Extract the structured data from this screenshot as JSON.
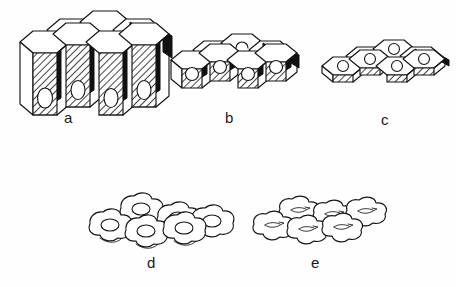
{
  "figure": {
    "background_color": "#fefefe",
    "ink_color": "#141414",
    "shade_color": "#111111",
    "panel_count": 5
  },
  "panels": [
    {
      "id": "a",
      "label": "a",
      "cell_shape": "tall columnar hexagonal prisms",
      "nucleus_shape": "oval",
      "nucleus_position": "basal",
      "rows": 2,
      "front_cells": 4,
      "back_cells": 3,
      "label_x": 68,
      "label_y": 117
    },
    {
      "id": "b",
      "label": "b",
      "cell_shape": "cuboidal hexagonal prisms",
      "nucleus_shape": "round",
      "nucleus_position": "central",
      "rows": 2,
      "front_cells": 4,
      "back_cells": 3,
      "label_x": 228,
      "label_y": 117
    },
    {
      "id": "c",
      "label": "c",
      "cell_shape": "low flattened hexagonal plates",
      "nucleus_shape": "round",
      "nucleus_position": "central",
      "rows": 2,
      "front_cells": 4,
      "back_cells": 3,
      "label_x": 384,
      "label_y": 112
    },
    {
      "id": "d",
      "label": "d",
      "cell_shape": "squamous polygonal blobs",
      "nucleus_shape": "oval",
      "nucleus_position": "central",
      "rows": 2,
      "front_cells": 3,
      "back_cells": 3,
      "label_x": 151,
      "label_y": 262
    },
    {
      "id": "e",
      "label": "e",
      "cell_shape": "very flat squamous cells",
      "nucleus_shape": "elongated spindle",
      "nucleus_position": "central",
      "rows": 2,
      "front_cells": 3,
      "back_cells": 3,
      "label_x": 315,
      "label_y": 262
    }
  ]
}
